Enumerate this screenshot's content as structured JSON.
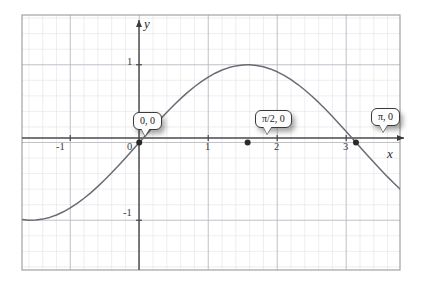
{
  "figure": {
    "kind": "cartesian-plot",
    "background_color": "#ffffff",
    "plot_border_color": "#9a9a9a",
    "minor_grid_color": "#e2e2ea",
    "major_grid_color": "#b9b9c4",
    "axis_color": "#4a4a4a",
    "curve_color": "#6b6b73",
    "point_color": "#2a2a2a"
  },
  "axes": {
    "x_axis_label": "x",
    "y_axis_label": "y",
    "x_tick_labels": [
      "-1",
      "0",
      "1",
      "2",
      "3"
    ],
    "x_tick_values": [
      -1,
      0,
      1,
      2,
      3
    ],
    "y_tick_labels": [
      "1",
      "-1"
    ],
    "y_tick_values": [
      1,
      -1
    ],
    "x_range": [
      -1.7,
      3.78
    ],
    "y_range": [
      -1.64,
      1.64
    ],
    "grid": true,
    "minor_grid_step": 0.2,
    "major_grid_step": 0.5
  },
  "callouts": [
    {
      "id": "origin",
      "label": "0, 0",
      "x": 0,
      "y": 0
    },
    {
      "id": "half-pi",
      "label": "π/2, 0",
      "x": 1.5708,
      "y": 0
    },
    {
      "id": "pi",
      "label": "π, 0",
      "x": 3.1416,
      "y": 0
    }
  ],
  "chart_data": {
    "type": "line",
    "title": "",
    "xlabel": "x",
    "ylabel": "y",
    "xlim": [
      -1.7,
      3.78
    ],
    "ylim": [
      -1.64,
      1.64
    ],
    "grid": true,
    "legend": "none",
    "series": [
      {
        "name": "sin(x)",
        "expression": "y = sin(x)",
        "x": [
          -1.7,
          -1.6,
          -1.5,
          -1.4,
          -1.3,
          -1.2,
          -1.1,
          -1.0,
          -0.9,
          -0.8,
          -0.7,
          -0.6,
          -0.5,
          -0.4,
          -0.3,
          -0.2,
          -0.1,
          0.0,
          0.1,
          0.2,
          0.3,
          0.4,
          0.5,
          0.6,
          0.7,
          0.8,
          0.9,
          1.0,
          1.1,
          1.2,
          1.3,
          1.4,
          1.5,
          1.5708,
          1.6,
          1.7,
          1.8,
          1.9,
          2.0,
          2.1,
          2.2,
          2.3,
          2.4,
          2.5,
          2.6,
          2.7,
          2.8,
          2.9,
          3.0,
          3.1,
          3.1416,
          3.2,
          3.3,
          3.4,
          3.5,
          3.6,
          3.7,
          3.78
        ],
        "y": [
          -0.9917,
          -0.9996,
          -0.9975,
          -0.9854,
          -0.9636,
          -0.932,
          -0.8912,
          -0.8415,
          -0.7833,
          -0.7174,
          -0.6442,
          -0.5646,
          -0.4794,
          -0.3894,
          -0.2955,
          -0.1987,
          -0.0998,
          0.0,
          0.0998,
          0.1987,
          0.2955,
          0.3894,
          0.4794,
          0.5646,
          0.6442,
          0.7174,
          0.7833,
          0.8415,
          0.8912,
          0.932,
          0.9636,
          0.9854,
          0.9975,
          1.0,
          0.9996,
          0.9917,
          0.9738,
          0.9463,
          0.9093,
          0.8632,
          0.8085,
          0.7457,
          0.6755,
          0.5985,
          0.5155,
          0.4274,
          0.335,
          0.2392,
          0.1411,
          0.0416,
          0.0,
          -0.0584,
          -0.1577,
          -0.2555,
          -0.3508,
          -0.4425,
          -0.5298,
          -0.5971
        ]
      }
    ],
    "annotations": [
      {
        "text": "0, 0",
        "x": 0,
        "y": 0
      },
      {
        "text": "π/2, 0",
        "x": 1.5708,
        "y": 0
      },
      {
        "text": "π, 0",
        "x": 3.1416,
        "y": 0
      }
    ],
    "marked_points": [
      {
        "label": "0, 0",
        "x": 0,
        "y": 0
      },
      {
        "label": "π/2, 0",
        "x": 1.5708,
        "y": 0
      },
      {
        "label": "π, 0",
        "x": 3.1416,
        "y": 0
      }
    ]
  }
}
